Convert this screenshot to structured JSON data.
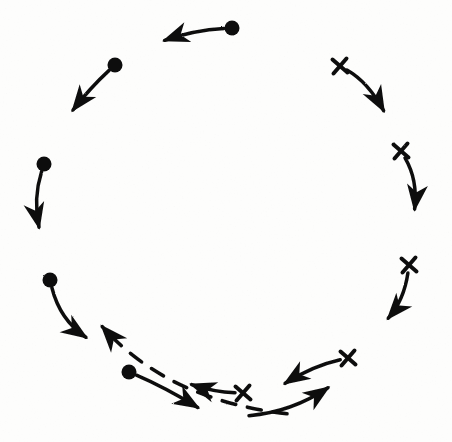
{
  "figure": {
    "title": "Circular arrangement of two marker groups with directional arrows",
    "width": 452,
    "height": 442,
    "background_color": "#fdfdfc",
    "ink_color": "#111111",
    "style": "hand-drawn scanned line art"
  },
  "chart_data": {
    "type": "scatter",
    "title": "",
    "xlabel": "",
    "ylabel": "",
    "xlim": [
      0,
      452
    ],
    "ylim": [
      0,
      442
    ],
    "grid": false,
    "legend": "none",
    "coordinate_note": "pixel coordinates, origin at top-left of the 452x442 image",
    "series": [
      {
        "name": "filled-circle-group",
        "marker": "filled-circle",
        "marker_radius": 7.5,
        "count": 5,
        "points": [
          {
            "id": "dot-1",
            "x": 232,
            "y": 28
          },
          {
            "id": "dot-2",
            "x": 115,
            "y": 65
          },
          {
            "id": "dot-3",
            "x": 44,
            "y": 164
          },
          {
            "id": "dot-4",
            "x": 50,
            "y": 280
          },
          {
            "id": "dot-5",
            "x": 129,
            "y": 372
          }
        ]
      },
      {
        "name": "cross-group",
        "marker": "x-cross",
        "marker_size": 15,
        "count": 5,
        "points": [
          {
            "id": "cross-1",
            "x": 340,
            "y": 66
          },
          {
            "id": "cross-2",
            "x": 401,
            "y": 151
          },
          {
            "id": "cross-3",
            "x": 409,
            "y": 265
          },
          {
            "id": "cross-4",
            "x": 348,
            "y": 358
          },
          {
            "id": "cross-5",
            "x": 243,
            "y": 393
          }
        ]
      }
    ],
    "arrows": [
      {
        "id": "arrow-dot-1",
        "linestyle": "solid",
        "from": {
          "x": 232,
          "y": 28
        },
        "to": {
          "x": 160,
          "y": 42
        },
        "control": {
          "x": 194,
          "y": 30
        },
        "direction": "left",
        "attached_marker": "dot-1"
      },
      {
        "id": "arrow-dot-2",
        "linestyle": "solid",
        "from": {
          "x": 115,
          "y": 65
        },
        "to": {
          "x": 70,
          "y": 114
        },
        "control": {
          "x": 90,
          "y": 88
        },
        "direction": "down-left",
        "attached_marker": "dot-2"
      },
      {
        "id": "arrow-dot-3",
        "linestyle": "solid",
        "from": {
          "x": 44,
          "y": 164
        },
        "to": {
          "x": 40,
          "y": 232
        },
        "control": {
          "x": 33,
          "y": 199
        },
        "direction": "down",
        "attached_marker": "dot-3"
      },
      {
        "id": "arrow-dot-4",
        "linestyle": "solid",
        "from": {
          "x": 50,
          "y": 280
        },
        "to": {
          "x": 90,
          "y": 340
        },
        "control": {
          "x": 60,
          "y": 320
        },
        "direction": "down-right",
        "attached_marker": "dot-4"
      },
      {
        "id": "arrow-dot-5",
        "linestyle": "solid",
        "from": {
          "x": 129,
          "y": 372
        },
        "to": {
          "x": 202,
          "y": 410
        },
        "control": {
          "x": 164,
          "y": 387
        },
        "direction": "right-down",
        "attached_marker": "dot-5"
      },
      {
        "id": "arrow-cross-1",
        "linestyle": "solid",
        "from": {
          "x": 340,
          "y": 66
        },
        "to": {
          "x": 386,
          "y": 115
        },
        "control": {
          "x": 368,
          "y": 82
        },
        "direction": "down-right",
        "attached_marker": "cross-1"
      },
      {
        "id": "arrow-cross-2",
        "linestyle": "solid",
        "from": {
          "x": 401,
          "y": 151
        },
        "to": {
          "x": 414,
          "y": 214
        },
        "control": {
          "x": 418,
          "y": 180
        },
        "direction": "down",
        "attached_marker": "cross-2"
      },
      {
        "id": "arrow-cross-3",
        "linestyle": "solid",
        "from": {
          "x": 409,
          "y": 265
        },
        "to": {
          "x": 385,
          "y": 322
        },
        "control": {
          "x": 404,
          "y": 300
        },
        "direction": "down-left",
        "attached_marker": "cross-3"
      },
      {
        "id": "arrow-cross-4",
        "linestyle": "solid",
        "from": {
          "x": 348,
          "y": 358
        },
        "to": {
          "x": 281,
          "y": 386
        },
        "control": {
          "x": 312,
          "y": 366
        },
        "direction": "left",
        "attached_marker": "cross-4"
      },
      {
        "id": "arrow-cross-5",
        "linestyle": "solid",
        "from": {
          "x": 243,
          "y": 393
        },
        "to": {
          "x": 187,
          "y": 383
        },
        "control": {
          "x": 214,
          "y": 392
        },
        "direction": "left",
        "attached_marker": "cross-5"
      },
      {
        "id": "arrow-lower-right-rising",
        "linestyle": "solid",
        "from": {
          "x": 246,
          "y": 416
        },
        "to": {
          "x": 332,
          "y": 385
        },
        "control": {
          "x": 292,
          "y": 412
        },
        "direction": "up-right",
        "attached_marker": "none"
      },
      {
        "id": "arrow-dashed-return",
        "linestyle": "dashed",
        "dash_pattern": [
          14,
          12
        ],
        "from": {
          "x": 290,
          "y": 414
        },
        "to": {
          "x": 99,
          "y": 323
        },
        "control": {
          "x": 168,
          "y": 400
        },
        "direction": "up-left",
        "attached_marker": "none"
      }
    ],
    "annotations": []
  }
}
